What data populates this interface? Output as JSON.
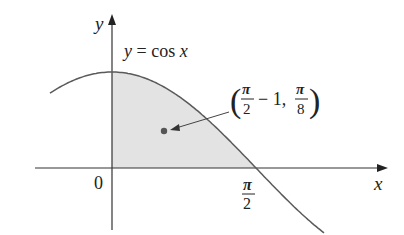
{
  "figure": {
    "type": "diagram",
    "axes": {
      "x_label": "x",
      "y_label": "y",
      "origin_label": "0",
      "x_tick_label": {
        "numerator": "π",
        "denominator": "2"
      }
    },
    "curve": {
      "equation_label": "y = cos x",
      "function": "cos"
    },
    "region": {
      "from": "0",
      "to": "π/2",
      "fill": "#e3e3e3"
    },
    "point": {
      "label_open": "(",
      "x_num": "π",
      "x_den": "2",
      "x_suffix": " − 1,",
      "y_num": "π",
      "y_den": "8",
      "label_close": ")",
      "color": "#555555"
    },
    "colors": {
      "line": "#555555",
      "axis": "#333333",
      "text": "#222222"
    }
  }
}
